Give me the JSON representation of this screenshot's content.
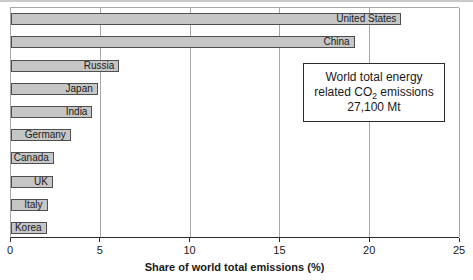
{
  "chart_data": {
    "type": "bar",
    "orientation": "horizontal",
    "title": "",
    "xlabel": "Share of world total emissions (%)",
    "ylabel": "",
    "xlim": [
      0,
      25
    ],
    "xticks": [
      0,
      5,
      10,
      15,
      20,
      25
    ],
    "grid": true,
    "categories": [
      "United States",
      "China",
      "Russia",
      "Japan",
      "India",
      "Germany",
      "Canada",
      "UK",
      "Italy",
      "Korea"
    ],
    "values": [
      21.4,
      18.8,
      5.7,
      4.5,
      4.2,
      3.0,
      2.05,
      2.0,
      1.7,
      1.65
    ],
    "annotation_text": "World total energy related CO2 emissions 27,100 Mt"
  },
  "annotation": {
    "line1": "World total energy",
    "line2_pre": "related CO",
    "line2_sub": "2",
    "line2_post": " emissions",
    "line3": "27,100 Mt"
  },
  "colors": {
    "bar_fill": "#c6c6c6",
    "bar_border": "#4f4f4f",
    "gridline": "#a8a8a8",
    "axis_line": "#2b2b2b",
    "text": "#1a1a1a",
    "scan_edge": "#c9c9c9"
  }
}
